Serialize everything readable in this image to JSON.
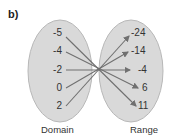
{
  "title": "b)",
  "domain_label": "Domain",
  "range_label": "Range",
  "domain": [
    "-5",
    "-4",
    "-2",
    "0",
    "2"
  ],
  "range": [
    "-24",
    "-14",
    "-4",
    "6",
    "11"
  ],
  "mappings": [
    [
      "-5",
      "11"
    ],
    [
      "-4",
      "6"
    ],
    [
      "-2",
      "-4"
    ],
    [
      "0",
      "-14"
    ],
    [
      "2",
      "-24"
    ]
  ],
  "colors": {
    "oval": "#d9d9d9",
    "oval_stroke": "#b8b8b8",
    "arrow": "#707070"
  }
}
